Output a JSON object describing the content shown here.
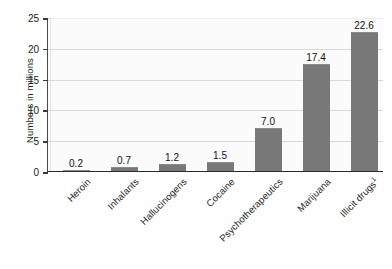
{
  "chart_data": {
    "type": "bar",
    "title": "",
    "subtitle": "",
    "xlabel": "",
    "ylabel": "Numbers in millions",
    "ylim": [
      0,
      25
    ],
    "yticks": [
      0,
      5,
      10,
      15,
      20,
      25
    ],
    "ytick_labels": [
      "0",
      "5",
      "10",
      "15",
      "20",
      "25"
    ],
    "grid": "horizontal",
    "legend": "none",
    "bar_color": "#787878",
    "plot_background": "#fbfbfb",
    "axis_color": "#2b2b2b",
    "gridline_color": "#d9d9d9",
    "categories": [
      "Heroin",
      "Inhalants",
      "Hallucinogens",
      "Cocaine",
      "Psychotherapeutics",
      "Marijuana",
      "Illicit drugs"
    ],
    "category_footnotes": [
      "",
      "",
      "",
      "",
      "",
      "",
      "1"
    ],
    "values": [
      0.2,
      0.7,
      1.2,
      1.5,
      7.0,
      17.4,
      22.6
    ],
    "value_labels": [
      "0.2",
      "0.7",
      "1.2",
      "1.5",
      "7.0",
      "17.4",
      "22.6"
    ]
  },
  "axis": {
    "y_title": "Numbers in millions"
  }
}
